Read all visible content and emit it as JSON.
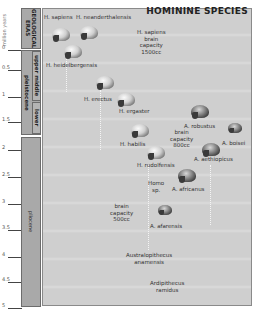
{
  "title": "HOMININE SPECIES",
  "axis": {
    "title": "million years",
    "ticks": [
      "0",
      "0.5",
      "1",
      "1.5",
      "2",
      "2.5",
      "3",
      "3.5",
      "4",
      "4.5",
      "5"
    ]
  },
  "eras": {
    "header": "GEOLOGICAL ERAS",
    "epochs": [
      {
        "name": "pleistocene",
        "subdivisions": [
          "upper middle",
          "lower"
        ]
      },
      {
        "name": "pliocene"
      }
    ]
  },
  "species": [
    {
      "name": "H. sapiens",
      "skull": "light"
    },
    {
      "name": "H. neanderthalensis",
      "skull": "light"
    },
    {
      "name": "H. heidelbergensis",
      "skull": "light"
    },
    {
      "name": "H. erectus",
      "skull": "light"
    },
    {
      "name": "H. ergaster",
      "skull": "light"
    },
    {
      "name": "H. habilis",
      "skull": "light"
    },
    {
      "name": "H. rudolfensis",
      "skull": "light"
    },
    {
      "name": "A. robustus",
      "skull": "dark"
    },
    {
      "name": "A. boisei",
      "skull": "dark"
    },
    {
      "name": "A. aethiopicus",
      "skull": "dark"
    },
    {
      "name": "A. africanus",
      "skull": "dark"
    },
    {
      "name": "A. afarensis",
      "skull": "dark"
    },
    {
      "name": "Australopithecus anamensis"
    },
    {
      "name": "Ardipithecus ramidus"
    }
  ],
  "annotations": {
    "sapiens_brain": [
      "H. sapiens",
      "brain",
      "capacity",
      "1500cc"
    ],
    "brain_800": [
      "brain",
      "capacity",
      "800cc"
    ],
    "homo_sp": [
      "Homo",
      "sp."
    ],
    "brain_500": [
      "brain",
      "capacity",
      "500cc"
    ],
    "anamensis": [
      "Australopithecus",
      "anamensis"
    ],
    "ramidus": [
      "Ardipithecus",
      "ramidus"
    ]
  }
}
